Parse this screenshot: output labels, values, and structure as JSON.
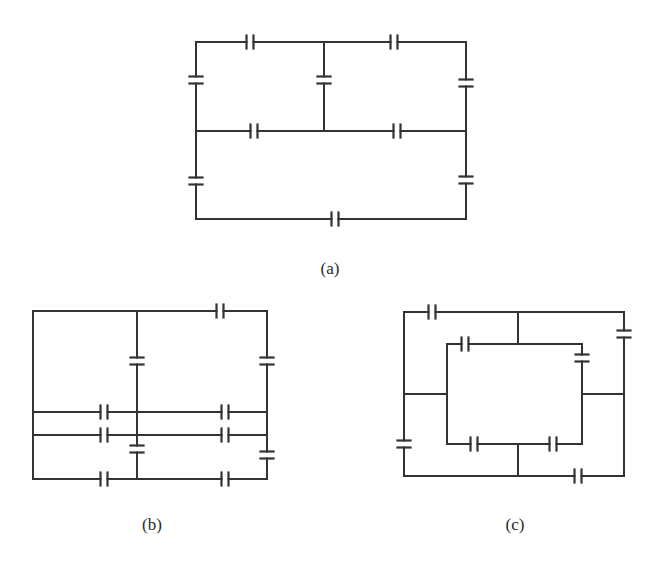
{
  "figure": {
    "stroke_color": "#333333",
    "background": "#ffffff"
  },
  "circuits": [
    {
      "id": "a",
      "label": "(a)",
      "label_pos": [
        330,
        269
      ],
      "wires": [
        [
          [
            196,
            42
          ],
          [
            466,
            42
          ]
        ],
        [
          [
            196,
            42
          ],
          [
            196,
            219
          ]
        ],
        [
          [
            466,
            42
          ],
          [
            466,
            219
          ]
        ],
        [
          [
            196,
            219
          ],
          [
            466,
            219
          ]
        ],
        [
          [
            324,
            42
          ],
          [
            324,
            131
          ]
        ],
        [
          [
            196,
            131
          ],
          [
            466,
            131
          ]
        ]
      ],
      "capacitors": [
        {
          "x": 250,
          "y": 42,
          "orient": "v"
        },
        {
          "x": 394,
          "y": 42,
          "orient": "v"
        },
        {
          "x": 196,
          "y": 80,
          "orient": "h"
        },
        {
          "x": 324,
          "y": 80,
          "orient": "h"
        },
        {
          "x": 466,
          "y": 83,
          "orient": "h"
        },
        {
          "x": 254,
          "y": 131,
          "orient": "v"
        },
        {
          "x": 397,
          "y": 131,
          "orient": "v"
        },
        {
          "x": 196,
          "y": 181,
          "orient": "h"
        },
        {
          "x": 466,
          "y": 180,
          "orient": "h"
        },
        {
          "x": 335,
          "y": 219,
          "orient": "v"
        }
      ]
    },
    {
      "id": "b",
      "label": "(b)",
      "label_pos": [
        152,
        525
      ],
      "wires": [
        [
          [
            33,
            311
          ],
          [
            267,
            311
          ]
        ],
        [
          [
            33,
            311
          ],
          [
            33,
            479
          ]
        ],
        [
          [
            267,
            311
          ],
          [
            267,
            479
          ]
        ],
        [
          [
            33,
            479
          ],
          [
            267,
            479
          ]
        ],
        [
          [
            137,
            311
          ],
          [
            137,
            479
          ]
        ],
        [
          [
            33,
            412
          ],
          [
            267,
            412
          ]
        ],
        [
          [
            33,
            435
          ],
          [
            267,
            435
          ]
        ]
      ],
      "capacitors": [
        {
          "x": 220,
          "y": 311,
          "orient": "v"
        },
        {
          "x": 137,
          "y": 361,
          "orient": "h"
        },
        {
          "x": 267,
          "y": 361,
          "orient": "h"
        },
        {
          "x": 104,
          "y": 412,
          "orient": "v"
        },
        {
          "x": 225,
          "y": 412,
          "orient": "v"
        },
        {
          "x": 104,
          "y": 435,
          "orient": "v"
        },
        {
          "x": 225,
          "y": 435,
          "orient": "v"
        },
        {
          "x": 137,
          "y": 449,
          "orient": "h"
        },
        {
          "x": 267,
          "y": 455,
          "orient": "h"
        },
        {
          "x": 104,
          "y": 479,
          "orient": "v"
        },
        {
          "x": 225,
          "y": 479,
          "orient": "v"
        }
      ]
    },
    {
      "id": "c",
      "label": "(c)",
      "label_pos": [
        515,
        525
      ],
      "wires": [
        [
          [
            404,
            312
          ],
          [
            624,
            312
          ]
        ],
        [
          [
            404,
            312
          ],
          [
            404,
            476
          ]
        ],
        [
          [
            624,
            312
          ],
          [
            624,
            476
          ]
        ],
        [
          [
            404,
            476
          ],
          [
            624,
            476
          ]
        ],
        [
          [
            447,
            344
          ],
          [
            582,
            344
          ]
        ],
        [
          [
            447,
            344
          ],
          [
            447,
            444
          ]
        ],
        [
          [
            582,
            344
          ],
          [
            582,
            444
          ]
        ],
        [
          [
            447,
            444
          ],
          [
            582,
            444
          ]
        ],
        [
          [
            518,
            312
          ],
          [
            518,
            344
          ]
        ],
        [
          [
            518,
            444
          ],
          [
            518,
            476
          ]
        ],
        [
          [
            404,
            394
          ],
          [
            447,
            394
          ]
        ],
        [
          [
            582,
            394
          ],
          [
            624,
            394
          ]
        ]
      ],
      "capacitors": [
        {
          "x": 432,
          "y": 312,
          "orient": "v"
        },
        {
          "x": 624,
          "y": 334,
          "orient": "h"
        },
        {
          "x": 465,
          "y": 344,
          "orient": "v"
        },
        {
          "x": 582,
          "y": 358,
          "orient": "h"
        },
        {
          "x": 404,
          "y": 444,
          "orient": "h"
        },
        {
          "x": 474,
          "y": 444,
          "orient": "v"
        },
        {
          "x": 553,
          "y": 444,
          "orient": "v"
        },
        {
          "x": 578,
          "y": 476,
          "orient": "v"
        }
      ]
    }
  ]
}
